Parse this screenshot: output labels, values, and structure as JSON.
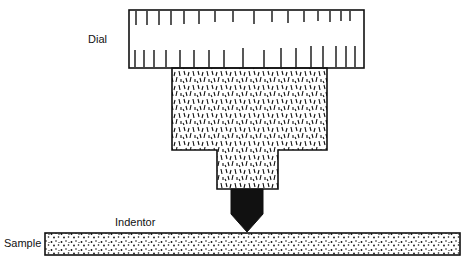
{
  "diagram": {
    "type": "hardness-tester-schematic",
    "labels": {
      "dial": "Dial",
      "indentor": "Indentor",
      "sample": "Sample"
    },
    "colors": {
      "ink": "#111111",
      "background": "#ffffff"
    }
  }
}
